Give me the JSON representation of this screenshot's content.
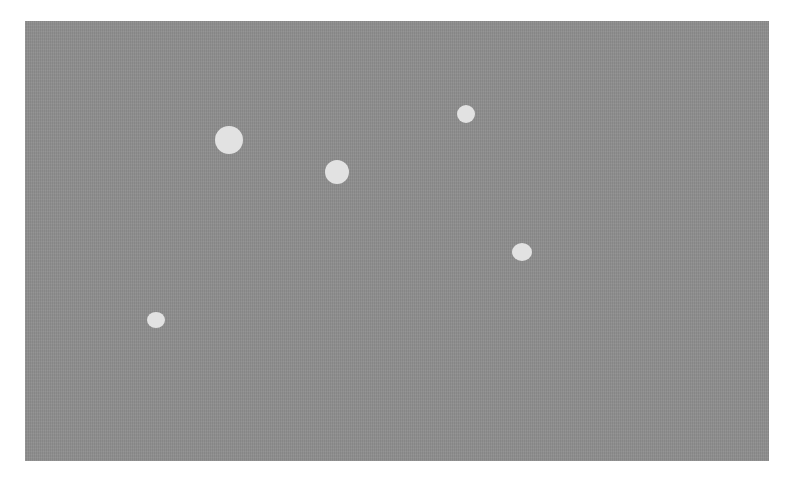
{
  "image": {
    "description": "Gray noisy rectangle with five light circular spots",
    "background_color": "#ffffff",
    "panel": {
      "x": 25,
      "y": 21,
      "width": 744,
      "height": 440,
      "color": "#8e8e8e"
    },
    "spot_color": "#e2e2e2",
    "spots": [
      {
        "cx": 229,
        "cy": 140,
        "rx": 14,
        "ry": 14
      },
      {
        "cx": 337,
        "cy": 172,
        "rx": 12,
        "ry": 12
      },
      {
        "cx": 466,
        "cy": 114,
        "rx": 9,
        "ry": 9
      },
      {
        "cx": 522,
        "cy": 252,
        "rx": 10,
        "ry": 9
      },
      {
        "cx": 156,
        "cy": 320,
        "rx": 9,
        "ry": 8
      }
    ]
  }
}
